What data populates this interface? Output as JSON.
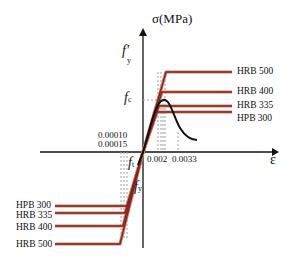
{
  "diagram": {
    "type": "stress-strain curve (steel rebar grades and concrete)",
    "axes": {
      "y_label": "σ(MPa)",
      "x_label": "ε"
    },
    "symbols": {
      "fy_prime": "f",
      "fy_prime_sub": "y",
      "fy_prime_mark": "'",
      "fc": "f",
      "fc_sub": "c",
      "ft": "f",
      "ft_sub": "t",
      "fy": "f",
      "fy_sub": "y"
    },
    "strain_ticks": {
      "t1": "0.00010",
      "t2": "0.00015",
      "t3": "0.002",
      "t4": "0.0033"
    },
    "compression_grades": [
      {
        "label": "HRB 500"
      },
      {
        "label": "HRB 400"
      },
      {
        "label": "HRB 335"
      },
      {
        "label": "HPB 300"
      }
    ],
    "tension_grades": [
      {
        "label": "HPB 300"
      },
      {
        "label": "HRB 335"
      },
      {
        "label": "HRB 400"
      },
      {
        "label": "HRB 500"
      }
    ],
    "colors": {
      "steel_line": "#8b1f1f",
      "steel_outline": "#c98a6a",
      "concrete_curve": "#111111",
      "axis": "#111111",
      "dashed": "#999999"
    }
  }
}
